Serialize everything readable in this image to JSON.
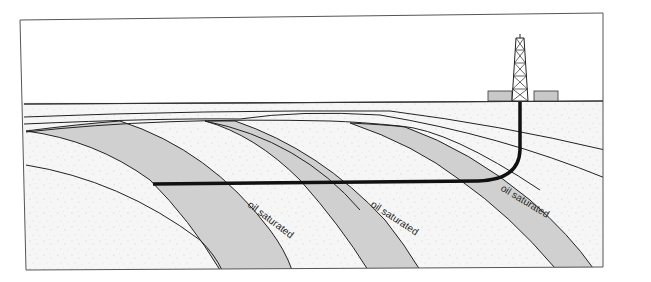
{
  "diagram": {
    "colors": {
      "background": "#ffffff",
      "sediment": "#f4f4f4",
      "oil_band": "#cfcfcf",
      "line": "#222222",
      "well": "#111111",
      "pad": "#c8c8c8"
    },
    "labels": [
      {
        "text": "oil saturated",
        "x": 248,
        "y": 216,
        "angle": 37
      },
      {
        "text": "oil saturated",
        "x": 370,
        "y": 216,
        "angle": 33
      },
      {
        "text": "oil saturated",
        "x": 500,
        "y": 200,
        "angle": 31
      }
    ],
    "elements": {
      "drilling_rig": "derrick-icon",
      "well_path": "horizontal-wellbore",
      "ground_surface": "surface-line"
    }
  }
}
